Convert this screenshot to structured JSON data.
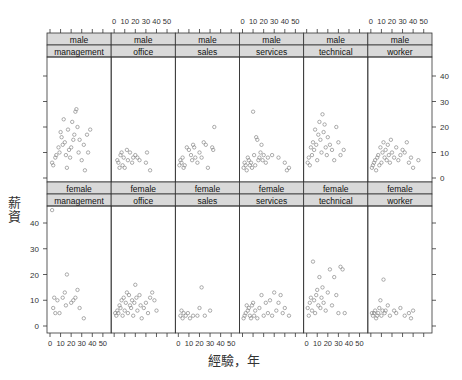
{
  "chart_data": {
    "type": "scatter",
    "title": "",
    "xlabel": "經驗，年",
    "ylabel": "薪資",
    "layout": "lattice 6 columns x 2 rows, strip headers (gender / occupation)",
    "xlim": [
      0,
      55
    ],
    "ylim": [
      -2,
      48
    ],
    "x_ticks": [
      0,
      10,
      20,
      30,
      40,
      50
    ],
    "y_ticks": [
      0,
      10,
      20,
      30,
      40
    ],
    "grid": false,
    "legend": null,
    "panels": [
      {
        "gender": "male",
        "occupation": "management",
        "points": [
          [
            2,
            6
          ],
          [
            3,
            5
          ],
          [
            5,
            8
          ],
          [
            6,
            9
          ],
          [
            8,
            12
          ],
          [
            9,
            10
          ],
          [
            10,
            18
          ],
          [
            11,
            16
          ],
          [
            12,
            13
          ],
          [
            13,
            23
          ],
          [
            14,
            14
          ],
          [
            15,
            9
          ],
          [
            16,
            4
          ],
          [
            17,
            19
          ],
          [
            18,
            11
          ],
          [
            19,
            8
          ],
          [
            20,
            12
          ],
          [
            21,
            22
          ],
          [
            22,
            15
          ],
          [
            23,
            17
          ],
          [
            24,
            26
          ],
          [
            25,
            27
          ],
          [
            26,
            20
          ],
          [
            27,
            10
          ],
          [
            28,
            15
          ],
          [
            30,
            7
          ],
          [
            32,
            13
          ],
          [
            33,
            3
          ],
          [
            35,
            17
          ],
          [
            36,
            10
          ],
          [
            38,
            19
          ]
        ]
      },
      {
        "gender": "male",
        "occupation": "office",
        "points": [
          [
            3,
            7
          ],
          [
            4,
            6
          ],
          [
            5,
            4
          ],
          [
            6,
            9
          ],
          [
            7,
            10
          ],
          [
            8,
            5
          ],
          [
            9,
            8
          ],
          [
            10,
            4
          ],
          [
            12,
            11
          ],
          [
            13,
            7
          ],
          [
            15,
            10
          ],
          [
            17,
            6
          ],
          [
            18,
            8
          ],
          [
            20,
            9
          ],
          [
            22,
            8
          ],
          [
            24,
            7
          ],
          [
            30,
            6
          ],
          [
            31,
            10
          ],
          [
            34,
            3
          ]
        ]
      },
      {
        "gender": "male",
        "occupation": "sales",
        "points": [
          [
            1,
            5
          ],
          [
            2,
            7
          ],
          [
            3,
            6
          ],
          [
            4,
            8
          ],
          [
            5,
            4
          ],
          [
            6,
            5
          ],
          [
            8,
            12
          ],
          [
            10,
            11
          ],
          [
            12,
            9
          ],
          [
            13,
            7
          ],
          [
            14,
            13
          ],
          [
            15,
            12
          ],
          [
            16,
            8
          ],
          [
            18,
            6
          ],
          [
            20,
            10
          ],
          [
            22,
            8
          ],
          [
            24,
            14
          ],
          [
            26,
            13
          ],
          [
            28,
            4
          ],
          [
            32,
            12
          ],
          [
            33,
            11
          ],
          [
            34,
            20
          ]
        ]
      },
      {
        "gender": "male",
        "occupation": "services",
        "points": [
          [
            1,
            4
          ],
          [
            2,
            6
          ],
          [
            3,
            5
          ],
          [
            4,
            3
          ],
          [
            5,
            8
          ],
          [
            6,
            7
          ],
          [
            7,
            5
          ],
          [
            8,
            6
          ],
          [
            9,
            4
          ],
          [
            10,
            26
          ],
          [
            11,
            9
          ],
          [
            12,
            5
          ],
          [
            13,
            16
          ],
          [
            14,
            15
          ],
          [
            15,
            7
          ],
          [
            16,
            8
          ],
          [
            17,
            10
          ],
          [
            18,
            13
          ],
          [
            19,
            7
          ],
          [
            20,
            9
          ],
          [
            22,
            6
          ],
          [
            24,
            8
          ],
          [
            28,
            9
          ],
          [
            34,
            8
          ],
          [
            40,
            6
          ],
          [
            42,
            3
          ],
          [
            44,
            4
          ]
        ]
      },
      {
        "gender": "male",
        "occupation": "technical",
        "points": [
          [
            1,
            6
          ],
          [
            2,
            8
          ],
          [
            3,
            5
          ],
          [
            4,
            12
          ],
          [
            5,
            9
          ],
          [
            6,
            14
          ],
          [
            7,
            11
          ],
          [
            8,
            19
          ],
          [
            9,
            13
          ],
          [
            10,
            7
          ],
          [
            11,
            17
          ],
          [
            12,
            22
          ],
          [
            13,
            15
          ],
          [
            14,
            10
          ],
          [
            15,
            25
          ],
          [
            16,
            18
          ],
          [
            17,
            21
          ],
          [
            18,
            12
          ],
          [
            19,
            9
          ],
          [
            20,
            16
          ],
          [
            22,
            13
          ],
          [
            24,
            11
          ],
          [
            26,
            7
          ],
          [
            28,
            20
          ],
          [
            30,
            14
          ],
          [
            32,
            9
          ],
          [
            35,
            11
          ]
        ]
      },
      {
        "gender": "male",
        "occupation": "worker",
        "points": [
          [
            1,
            4
          ],
          [
            2,
            5
          ],
          [
            3,
            6
          ],
          [
            4,
            7
          ],
          [
            5,
            3
          ],
          [
            6,
            8
          ],
          [
            7,
            9
          ],
          [
            8,
            5
          ],
          [
            9,
            12
          ],
          [
            10,
            6
          ],
          [
            11,
            10
          ],
          [
            12,
            14
          ],
          [
            13,
            8
          ],
          [
            14,
            11
          ],
          [
            15,
            7
          ],
          [
            16,
            13
          ],
          [
            17,
            9
          ],
          [
            18,
            6
          ],
          [
            19,
            15
          ],
          [
            20,
            10
          ],
          [
            22,
            8
          ],
          [
            24,
            12
          ],
          [
            26,
            7
          ],
          [
            28,
            9
          ],
          [
            30,
            11
          ],
          [
            32,
            10
          ],
          [
            34,
            14
          ],
          [
            36,
            6
          ],
          [
            38,
            8
          ],
          [
            40,
            4
          ],
          [
            45,
            7
          ]
        ]
      },
      {
        "gender": "female",
        "occupation": "management",
        "points": [
          [
            2,
            45
          ],
          [
            3,
            7
          ],
          [
            4,
            11
          ],
          [
            5,
            5
          ],
          [
            7,
            10
          ],
          [
            9,
            5
          ],
          [
            12,
            11
          ],
          [
            14,
            13
          ],
          [
            15,
            8
          ],
          [
            16,
            20
          ],
          [
            20,
            9
          ],
          [
            22,
            10
          ],
          [
            24,
            11
          ],
          [
            26,
            14
          ],
          [
            28,
            7
          ],
          [
            32,
            3
          ]
        ]
      },
      {
        "gender": "female",
        "occupation": "office",
        "points": [
          [
            1,
            5
          ],
          [
            2,
            4
          ],
          [
            3,
            6
          ],
          [
            4,
            5
          ],
          [
            5,
            8
          ],
          [
            6,
            7
          ],
          [
            7,
            10
          ],
          [
            8,
            4
          ],
          [
            9,
            11
          ],
          [
            10,
            6
          ],
          [
            11,
            9
          ],
          [
            12,
            13
          ],
          [
            13,
            5
          ],
          [
            14,
            12
          ],
          [
            15,
            8
          ],
          [
            16,
            7
          ],
          [
            17,
            10
          ],
          [
            18,
            4
          ],
          [
            19,
            9
          ],
          [
            20,
            16
          ],
          [
            21,
            11
          ],
          [
            22,
            6
          ],
          [
            24,
            12
          ],
          [
            25,
            8
          ],
          [
            26,
            3
          ],
          [
            28,
            7
          ],
          [
            30,
            9
          ],
          [
            32,
            5
          ],
          [
            34,
            11
          ],
          [
            36,
            13
          ],
          [
            38,
            10
          ],
          [
            40,
            6
          ]
        ]
      },
      {
        "gender": "female",
        "occupation": "sales",
        "points": [
          [
            2,
            4
          ],
          [
            3,
            6
          ],
          [
            4,
            3
          ],
          [
            5,
            5
          ],
          [
            7,
            4
          ],
          [
            9,
            5
          ],
          [
            11,
            3
          ],
          [
            14,
            4
          ],
          [
            18,
            4
          ],
          [
            20,
            7
          ],
          [
            22,
            15
          ],
          [
            25,
            4
          ],
          [
            30,
            6
          ]
        ]
      },
      {
        "gender": "female",
        "occupation": "services",
        "points": [
          [
            1,
            3
          ],
          [
            2,
            4
          ],
          [
            3,
            5
          ],
          [
            4,
            8
          ],
          [
            5,
            6
          ],
          [
            6,
            7
          ],
          [
            7,
            4
          ],
          [
            8,
            3
          ],
          [
            9,
            8
          ],
          [
            10,
            9
          ],
          [
            11,
            4
          ],
          [
            12,
            6
          ],
          [
            14,
            3
          ],
          [
            16,
            7
          ],
          [
            18,
            12
          ],
          [
            20,
            4
          ],
          [
            22,
            9
          ],
          [
            24,
            5
          ],
          [
            26,
            10
          ],
          [
            28,
            4
          ],
          [
            30,
            13
          ],
          [
            32,
            6
          ],
          [
            34,
            9
          ],
          [
            36,
            12
          ],
          [
            38,
            5
          ],
          [
            40,
            7
          ],
          [
            44,
            4
          ]
        ]
      },
      {
        "gender": "female",
        "occupation": "technical",
        "points": [
          [
            1,
            7
          ],
          [
            2,
            4
          ],
          [
            3,
            9
          ],
          [
            4,
            11
          ],
          [
            5,
            6
          ],
          [
            6,
            25
          ],
          [
            7,
            10
          ],
          [
            8,
            5
          ],
          [
            9,
            12
          ],
          [
            10,
            14
          ],
          [
            11,
            8
          ],
          [
            12,
            19
          ],
          [
            13,
            7
          ],
          [
            14,
            11
          ],
          [
            15,
            15
          ],
          [
            16,
            9
          ],
          [
            18,
            6
          ],
          [
            20,
            13
          ],
          [
            22,
            22
          ],
          [
            24,
            8
          ],
          [
            26,
            19
          ],
          [
            28,
            12
          ],
          [
            30,
            5
          ],
          [
            32,
            23
          ],
          [
            34,
            22
          ],
          [
            36,
            5
          ]
        ]
      },
      {
        "gender": "female",
        "occupation": "worker",
        "points": [
          [
            1,
            5
          ],
          [
            2,
            4
          ],
          [
            3,
            5
          ],
          [
            4,
            6
          ],
          [
            5,
            3
          ],
          [
            6,
            4
          ],
          [
            7,
            5
          ],
          [
            8,
            7
          ],
          [
            9,
            10
          ],
          [
            10,
            4
          ],
          [
            11,
            6
          ],
          [
            12,
            18
          ],
          [
            13,
            5
          ],
          [
            14,
            6
          ],
          [
            16,
            8
          ],
          [
            18,
            4
          ],
          [
            22,
            6
          ],
          [
            24,
            5
          ],
          [
            28,
            7
          ],
          [
            32,
            4
          ],
          [
            36,
            5
          ],
          [
            38,
            3
          ],
          [
            40,
            6
          ]
        ]
      }
    ]
  },
  "axis": {
    "top_ticks_label": "0 10 20 30 40 50",
    "bottom_ticks_label": "0 10 20 30 40 50",
    "right_ticks": [
      "0",
      "10",
      "20",
      "30",
      "40"
    ],
    "left_ticks": [
      "0",
      "10",
      "20",
      "30",
      "40"
    ]
  },
  "labels": {
    "xlabel": "經驗，年",
    "ylabel": "薪資"
  },
  "colors": {
    "strip_bg": "#d9d9d9",
    "point": "#888888",
    "frame": "#333333",
    "text": "#333333"
  }
}
